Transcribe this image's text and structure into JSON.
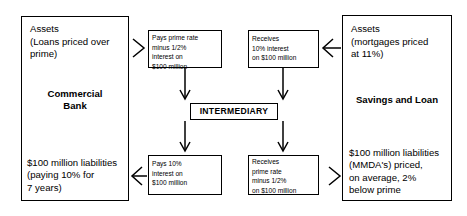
{
  "diagram": {
    "title": "INTERMEDIARY",
    "institutions": {
      "left": {
        "name": "Commercial\nBank",
        "assets_heading": "Assets",
        "assets_detail": "(Loans priced over\nprime)",
        "liabilities": "$100 million liabilities\n(paying 10% for\n7 years)"
      },
      "right": {
        "name": "Savings and Loan",
        "assets_heading": "Assets",
        "assets_detail": "(mortgages priced\nat 11%)",
        "liabilities": "$100 million liabilities\n(MMDA's) priced,\non average, 2%\nbelow prime"
      }
    },
    "flows": {
      "top_left": "Pays prime rate\nminus 1/2%\ninterest on\n$100 million",
      "top_right": "Receives\n10% interest\non $100 million",
      "bottom_left": "Pays 10%\ninterest on\n$100 million",
      "bottom_right": "Receives\nprime rate\nminus 1/2%\non $100 million"
    },
    "colors": {
      "stroke": "#000000",
      "background": "#ffffff"
    }
  }
}
